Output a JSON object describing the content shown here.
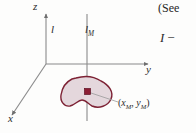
{
  "figure": {
    "name": "parallel-axis-theorem-diagram",
    "background_color": "#fdfdfc",
    "axes": {
      "z_label": "z",
      "y_label": "y",
      "x_label": "x",
      "axis_color": "#8a8a8a",
      "origin": {
        "x": 46,
        "y": 64
      }
    },
    "lines": {
      "reference_axis_label": "l",
      "centroidal_axis_label": "l",
      "centroidal_axis_subscript": "M",
      "line_color": "#8a8a8a"
    },
    "shape": {
      "name": "cross-section-blob",
      "fill_color": "#e4d7dc",
      "stroke_color": "#7d2234"
    },
    "centroid": {
      "label_open": "(",
      "label_x": "x",
      "label_x_sub": "M",
      "label_comma": ", ",
      "label_y": "y",
      "label_y_sub": "M",
      "label_close": ")",
      "dot_color": "#8c1d33",
      "leader_color": "#9a9a9a"
    },
    "side_text": {
      "caption": "(See",
      "formula_symbol": "I",
      "formula_operator": "−"
    }
  }
}
